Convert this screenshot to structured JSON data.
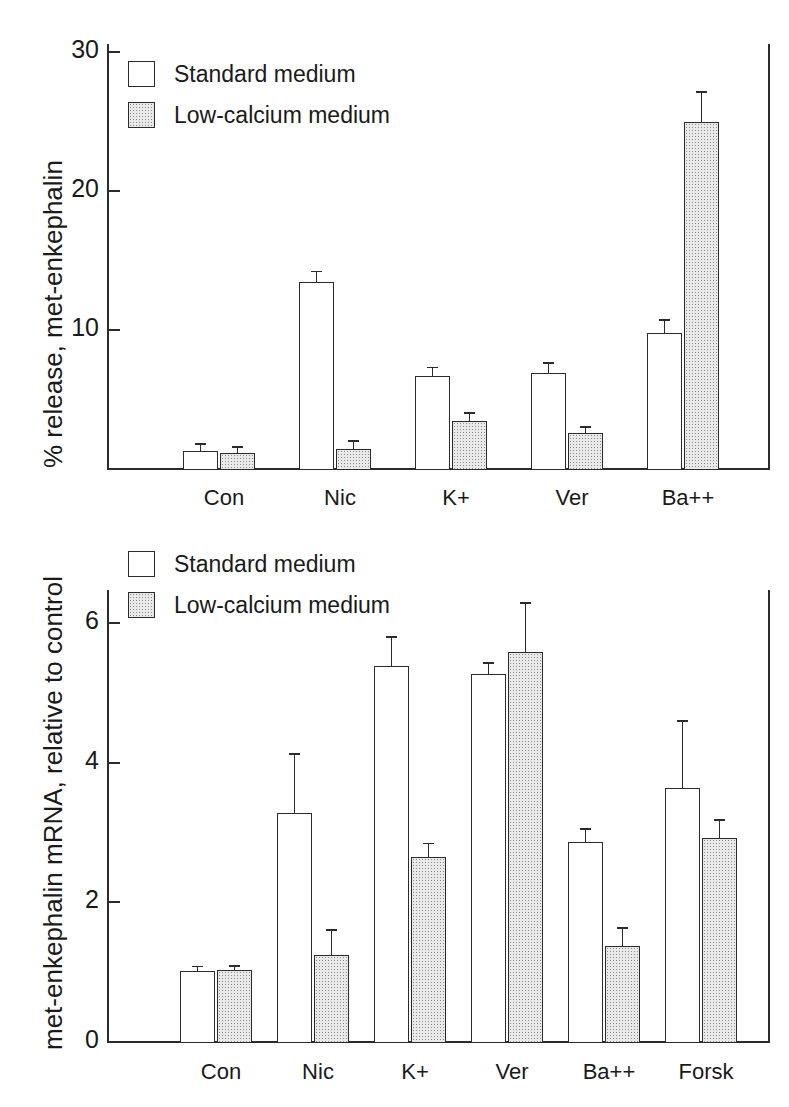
{
  "figure": {
    "background_color": "#ffffff",
    "ink_color": "#2b2b2b",
    "hatch_fill_color": "#e9e9e9"
  },
  "legend": {
    "standard_label": "Standard medium",
    "lowcal_label": "Low-calcium medium"
  },
  "panel_top": {
    "ylabel": "% release, met-enkephalin",
    "ytick_labels": [
      "30",
      "20",
      "10"
    ],
    "xtick_labels": [
      "Con",
      "Nic",
      "K+",
      "Ver",
      "Ba++"
    ]
  },
  "panel_bottom": {
    "ylabel": "met-enkephalin mRNA,  relative to control",
    "ytick_labels": [
      "6",
      "4",
      "2",
      "0"
    ],
    "xtick_labels": [
      "Con",
      "Nic",
      "K+",
      "Ver",
      "Ba++",
      "Forsk"
    ]
  },
  "chart_data": [
    {
      "type": "bar",
      "id": "percent-release",
      "title": "",
      "xlabel": "",
      "ylabel": "% release, met-enkephalin",
      "ylim": [
        0,
        31
      ],
      "yticks": [
        10,
        20,
        30
      ],
      "grid": false,
      "legend_position": "upper-left",
      "categories": [
        "Con",
        "Nic",
        "K+",
        "Ver",
        "Ba++"
      ],
      "series": [
        {
          "name": "Standard medium",
          "fill": "white",
          "values": [
            1.2,
            13.4,
            6.6,
            6.8,
            9.7
          ],
          "errors": [
            0.6,
            0.8,
            0.7,
            0.8,
            1.0
          ]
        },
        {
          "name": "Low-calcium medium",
          "fill": "stippled",
          "values": [
            1.1,
            1.4,
            3.4,
            2.5,
            24.9
          ],
          "errors": [
            0.5,
            0.6,
            0.6,
            0.5,
            2.2
          ]
        }
      ]
    },
    {
      "type": "bar",
      "id": "mrna-relative",
      "title": "",
      "xlabel": "",
      "ylabel": "met-enkephalin mRNA, relative to control",
      "ylim": [
        0,
        7
      ],
      "yticks": [
        0,
        2,
        4,
        6
      ],
      "grid": false,
      "legend_position": "upper-left",
      "categories": [
        "Con",
        "Nic",
        "K+",
        "Ver",
        "Ba++",
        "Forsk"
      ],
      "series": [
        {
          "name": "Standard medium",
          "fill": "white",
          "values": [
            1.0,
            3.27,
            5.37,
            5.26,
            2.85,
            3.63
          ],
          "errors": [
            0.08,
            0.85,
            0.43,
            0.17,
            0.2,
            0.97
          ]
        },
        {
          "name": "Low-calcium medium",
          "fill": "stippled",
          "values": [
            1.02,
            1.23,
            2.64,
            5.57,
            1.36,
            2.9
          ],
          "errors": [
            0.07,
            0.37,
            0.2,
            0.72,
            0.27,
            0.28
          ]
        }
      ]
    }
  ]
}
